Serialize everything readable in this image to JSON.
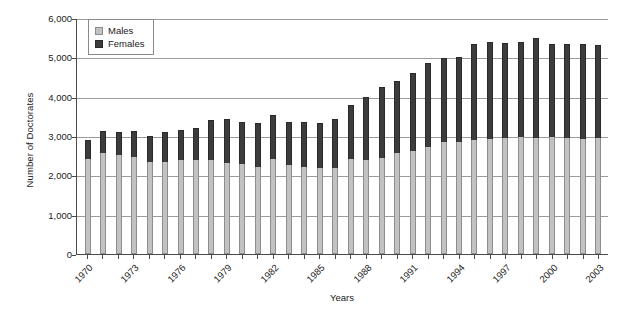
{
  "chart_data": {
    "type": "bar",
    "subtype": "stacked-column",
    "title": "",
    "xlabel": "Years",
    "ylabel": "Number of Doctorates",
    "ylim": [
      0,
      6000
    ],
    "ytick_labels": [
      "6,000",
      "5,000",
      "4,000",
      "3,000",
      "2,000",
      "1,000",
      "0"
    ],
    "ytick_values": [
      6000,
      5000,
      4000,
      3000,
      2000,
      1000,
      0
    ],
    "grid": true,
    "legend_position": "top-left-inside",
    "categories": [
      "1970",
      "1971",
      "1972",
      "1973",
      "1974",
      "1975",
      "1976",
      "1977",
      "1978",
      "1979",
      "1980",
      "1981",
      "1982",
      "1983",
      "1984",
      "1985",
      "1986",
      "1987",
      "1988",
      "1989",
      "1990",
      "1991",
      "1992",
      "1993",
      "1994",
      "1995",
      "1996",
      "1997",
      "1998",
      "1999",
      "2000",
      "2001",
      "2002",
      "2003"
    ],
    "xtick_labels_shown": [
      "1970",
      "1973",
      "1976",
      "1979",
      "1982",
      "1985",
      "1988",
      "1991",
      "1994",
      "1997",
      "2000",
      "2003"
    ],
    "colors": {
      "males": "#c2c2c2",
      "females": "#3c3c3c",
      "gridline": "#9b9b9b",
      "axis": "#4a4a4a"
    },
    "series": [
      {
        "name": "Males",
        "color": "#c2c2c2",
        "values": [
          2420,
          2580,
          2530,
          2470,
          2330,
          2330,
          2400,
          2380,
          2400,
          2320,
          2290,
          2220,
          2410,
          2260,
          2200,
          2180,
          2180,
          2410,
          2400,
          2440,
          2560,
          2620,
          2720,
          2860,
          2860,
          2900,
          2920,
          2960,
          2980,
          2960,
          2980,
          2960,
          2920,
          2940
        ]
      },
      {
        "name": "Females",
        "color": "#3c3c3c",
        "values": [
          470,
          540,
          580,
          670,
          680,
          760,
          750,
          830,
          1010,
          1100,
          1060,
          1110,
          1130,
          1090,
          1150,
          1160,
          1260,
          1370,
          1600,
          1810,
          1840,
          1980,
          2130,
          2120,
          2140,
          2440,
          2470,
          2410,
          2400,
          2540,
          2360,
          2370,
          2430,
          2380
        ]
      }
    ],
    "totals": [
      2890,
      3120,
      3110,
      3140,
      3010,
      3090,
      3150,
      3210,
      3410,
      3420,
      3350,
      3330,
      3540,
      3350,
      3350,
      3340,
      3440,
      3780,
      4000,
      4250,
      4400,
      4600,
      4850,
      4980,
      5000,
      5340,
      5390,
      5370,
      5380,
      5500,
      5340,
      5330,
      5350,
      5320
    ]
  },
  "legend": {
    "items": [
      {
        "label": "Males"
      },
      {
        "label": "Females"
      }
    ]
  }
}
